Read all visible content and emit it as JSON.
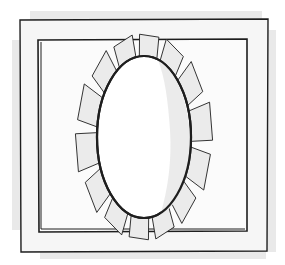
{
  "illustration": {
    "subject": "framed oval mirror with scalloped petal border",
    "petal_count": 14,
    "colors": {
      "background": "#ffffff",
      "outer_frame_fill": "#f6f6f6",
      "outer_frame_shadow": "#e4e4e4",
      "inner_frame_fill": "#fbfbfb",
      "petal_fill": "#ebebeb",
      "oval_fill": "#ffffff",
      "oval_shade": "#e9e9e9",
      "stroke": "#1e1e1e"
    }
  }
}
